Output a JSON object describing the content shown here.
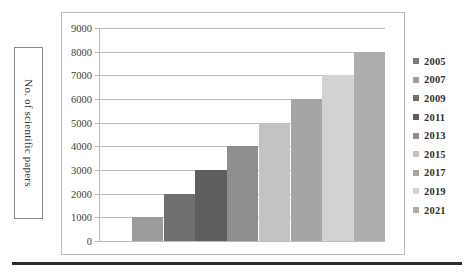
{
  "axis_title": {
    "text": "No. of scientific papers"
  },
  "caption": {
    "text": ""
  },
  "legend": {
    "position": "right",
    "items": [
      {
        "label": "2005",
        "color": "#7b7b7b"
      },
      {
        "label": "2007",
        "color": "#9c9c9c"
      },
      {
        "label": "2009",
        "color": "#6f6f6f"
      },
      {
        "label": "2011",
        "color": "#5e5e5e"
      },
      {
        "label": "2013",
        "color": "#8e8e8e"
      },
      {
        "label": "2015",
        "color": "#c3c3c3"
      },
      {
        "label": "2017",
        "color": "#a5a5a5"
      },
      {
        "label": "2019",
        "color": "#d2d2d2"
      },
      {
        "label": "2021",
        "color": "#adadad"
      }
    ]
  },
  "chart_data": {
    "type": "bar",
    "title": "",
    "xlabel": "",
    "ylabel": "No. of scientific papers",
    "ylim": [
      0,
      9000
    ],
    "ytick_step": 1000,
    "yticks": [
      9000,
      8000,
      7000,
      6000,
      5000,
      4000,
      3000,
      2000,
      1000,
      0
    ],
    "ytick_labels": [
      "9000",
      "8000",
      "7000",
      "6000",
      "5000",
      "4000",
      "3000",
      "2000",
      "1000",
      "0"
    ],
    "grid": true,
    "grid_axis": "y",
    "categories": [
      "2005",
      "2007",
      "2009",
      "2011",
      "2013",
      "2015",
      "2017",
      "2019",
      "2021"
    ],
    "values": [
      0,
      1000,
      2000,
      3000,
      4000,
      5000,
      6000,
      7000,
      8000
    ],
    "colors": [
      "#7b7b7b",
      "#9c9c9c",
      "#6f6f6f",
      "#5e5e5e",
      "#8e8e8e",
      "#c3c3c3",
      "#a5a5a5",
      "#d2d2d2",
      "#adadad"
    ]
  }
}
